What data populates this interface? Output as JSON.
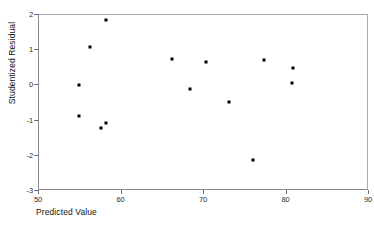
{
  "chart_data": {
    "type": "scatter",
    "title": "",
    "xlabel": "Predicted Value",
    "ylabel": "Studentized Residual",
    "xlim": [
      50,
      90
    ],
    "ylim": [
      -3,
      2
    ],
    "xticks": [
      50,
      60,
      70,
      80,
      90
    ],
    "yticks": [
      2,
      1,
      0,
      -1,
      -2,
      -3
    ],
    "xtick_labels": [
      "50",
      "60",
      "70",
      "80",
      "90"
    ],
    "ytick_labels": [
      "2",
      "1",
      "0",
      "-1",
      "-2",
      "-3"
    ],
    "grid": false,
    "legend": false,
    "marker": "filled-square",
    "marker_color": "#000000",
    "points": [
      {
        "x": 58.3,
        "y": 1.83
      },
      {
        "x": 56.3,
        "y": 1.06
      },
      {
        "x": 55.0,
        "y": -0.03
      },
      {
        "x": 55.0,
        "y": -0.91
      },
      {
        "x": 57.6,
        "y": -1.24
      },
      {
        "x": 58.2,
        "y": -1.09
      },
      {
        "x": 66.2,
        "y": 0.71
      },
      {
        "x": 68.4,
        "y": -0.13
      },
      {
        "x": 70.4,
        "y": 0.64
      },
      {
        "x": 73.2,
        "y": -0.51
      },
      {
        "x": 76.0,
        "y": -2.14
      },
      {
        "x": 77.4,
        "y": 0.68
      },
      {
        "x": 80.9,
        "y": 0.46
      },
      {
        "x": 80.8,
        "y": 0.04
      }
    ]
  },
  "figure": {
    "title_remnant": "",
    "axis_color": "#8a8a92",
    "background": "#ffffff",
    "text_color": "#1a1a1a"
  }
}
